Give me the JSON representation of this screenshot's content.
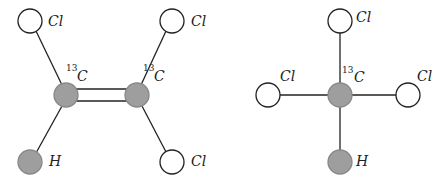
{
  "diagram": {
    "colors": {
      "carbon_fill": "#9e9e9e",
      "hydrogen_fill": "#9e9e9e",
      "chlorine_fill": "#ffffff",
      "stroke": "#222222"
    },
    "molecules": [
      {
        "name": "trichloroethylene-13C2",
        "atoms": [
          {
            "id": "cl1",
            "element": "Cl",
            "label": "Cl"
          },
          {
            "id": "cl2",
            "element": "Cl",
            "label": "Cl"
          },
          {
            "id": "c1",
            "element": "C",
            "isotope": "13",
            "label": "C"
          },
          {
            "id": "c2",
            "element": "C",
            "isotope": "13",
            "label": "C"
          },
          {
            "id": "h1",
            "element": "H",
            "label": "H"
          },
          {
            "id": "cl3",
            "element": "Cl",
            "label": "Cl"
          }
        ],
        "bonds": [
          {
            "from": "cl1",
            "to": "c1",
            "order": 1
          },
          {
            "from": "cl2",
            "to": "c2",
            "order": 1
          },
          {
            "from": "c1",
            "to": "c2",
            "order": 2
          },
          {
            "from": "c1",
            "to": "h1",
            "order": 1
          },
          {
            "from": "c2",
            "to": "cl3",
            "order": 1
          }
        ]
      },
      {
        "name": "chloroform-13C",
        "atoms": [
          {
            "id": "cl_top",
            "element": "Cl",
            "label": "Cl"
          },
          {
            "id": "cl_left",
            "element": "Cl",
            "label": "Cl"
          },
          {
            "id": "c",
            "element": "C",
            "isotope": "13",
            "label": "C"
          },
          {
            "id": "cl_right",
            "element": "Cl",
            "label": "Cl"
          },
          {
            "id": "h",
            "element": "H",
            "label": "H"
          }
        ],
        "bonds": [
          {
            "from": "c",
            "to": "cl_top",
            "order": 1
          },
          {
            "from": "c",
            "to": "cl_left",
            "order": 1
          },
          {
            "from": "c",
            "to": "cl_right",
            "order": 1
          },
          {
            "from": "c",
            "to": "h",
            "order": 1
          }
        ]
      }
    ]
  }
}
